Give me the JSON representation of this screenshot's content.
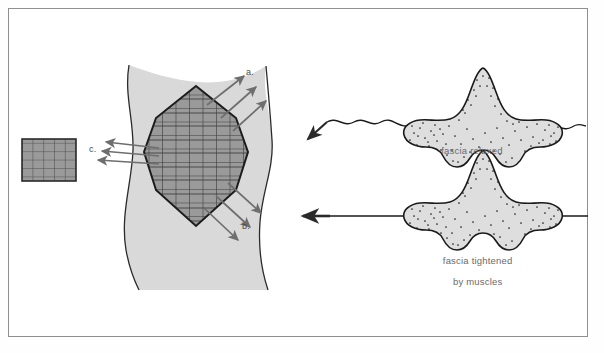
{
  "figure": {
    "background_color": "#ffffff",
    "frame_color": "#8f8f8f",
    "tissue_fill": "#d9d9d9",
    "tissue_stroke": "#2b2b2b",
    "lattice_fill": "#9a9a9a",
    "lattice_stroke": "#1c1c1c",
    "lattice_gridline": "#4a4a4a",
    "arrow_color": "#6e6e6e",
    "blob_fill": "#dedede",
    "blob_stroke": "#1a1a1a",
    "stipple_color": "#202020",
    "line_color": "#1a1a1a",
    "label_color": "#4a4a4a",
    "caption_color": "#6a6a6a"
  },
  "left_panel": {
    "name": "crystal-lattice-in-fascia",
    "small_lattice": {
      "name": "small-lattice-swatch",
      "rows": 5,
      "columns": 5,
      "x": 22,
      "y": 139,
      "width": 54,
      "height": 42
    },
    "large_lattice": {
      "name": "large-lattice-octagon",
      "rows": 8,
      "columns": 8,
      "center_x": 196,
      "center_y": 157
    },
    "markers": [
      {
        "id": "a",
        "label": "a.",
        "x": 246,
        "y": 68,
        "meaning": "outgoing force vectors upper right"
      },
      {
        "id": "b",
        "label": "b.",
        "x": 242,
        "y": 222,
        "meaning": "outgoing force vectors lower right"
      },
      {
        "id": "c",
        "label": "c.",
        "x": 89,
        "y": 145,
        "meaning": "incoming force vectors from left"
      }
    ],
    "arrow_groups": [
      {
        "name": "arrows-a",
        "count": 3,
        "direction": "up-right"
      },
      {
        "name": "arrows-b",
        "count": 3,
        "direction": "down-right"
      },
      {
        "name": "arrows-c",
        "count": 3,
        "direction": "up-left"
      }
    ]
  },
  "right_panel": {
    "name": "fascia-states",
    "diagrams": [
      {
        "name": "fascia-relaxed-diagram",
        "caption": "fascia relaxed",
        "line_style": "wavy",
        "arrow": {
          "name": "relaxed-arrow",
          "style": "double-headed-diagonal",
          "direction": "down-left"
        }
      },
      {
        "name": "fascia-tightened-diagram",
        "caption_line_1": "fascia tightened",
        "caption_line_2": "by muscles",
        "line_style": "straight",
        "arrow": {
          "name": "tightened-arrow",
          "style": "single-headed",
          "direction": "left"
        }
      }
    ]
  }
}
